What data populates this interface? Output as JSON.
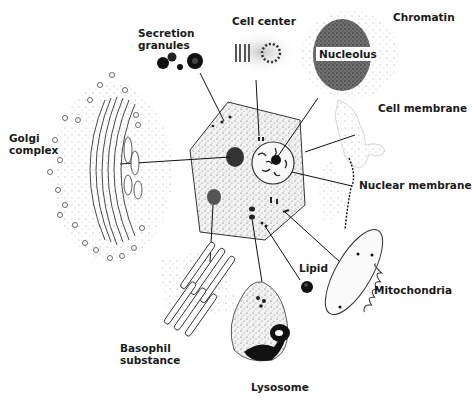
{
  "diagram": {
    "type": "cell-structure-illustration",
    "background": "#ffffff",
    "ink_color": "#1a1a1a",
    "center": "Cell",
    "labels": {
      "secretion_granules": [
        "Secretion",
        "granules"
      ],
      "cell_center": "Cell center",
      "chromatin": "Chromatin",
      "nucleolus": "Nucleolus",
      "cell_membrane": "Cell membrane",
      "golgi_complex": [
        "Golgi",
        "complex"
      ],
      "nuclear_membrane": "Nuclear membrane",
      "lipid": "Lipid",
      "mitochondria": "Mitochondria",
      "basophil_substance": [
        "Basophil",
        "substance"
      ],
      "lysosome": "Lysosome"
    },
    "connections": [
      {
        "from": "Secretion granules",
        "to": "cell cytoplasm granules"
      },
      {
        "from": "Cell center",
        "to": "centrioles near nucleus"
      },
      {
        "from": "Chromatin / Nucleolus",
        "to": "nucleolus"
      },
      {
        "from": "Cell membrane",
        "to": "cell edge"
      },
      {
        "from": "Golgi complex",
        "to": "dark mass near nucleus"
      },
      {
        "from": "Nuclear membrane",
        "to": "nucleus edge"
      },
      {
        "from": "Basophil substance",
        "to": "dark patch lower-left"
      },
      {
        "from": "Lysosome",
        "to": "dark bodies lower cell"
      },
      {
        "from": "Lipid",
        "to": "small droplets lower cell"
      },
      {
        "from": "Mitochondria",
        "to": "rod bodies lower-right"
      }
    ]
  }
}
